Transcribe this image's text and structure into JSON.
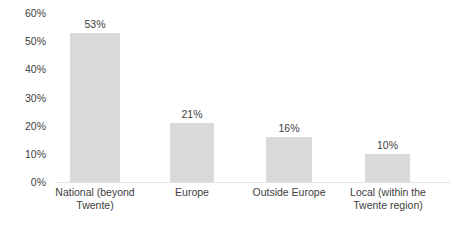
{
  "chart_data": {
    "type": "bar",
    "title": "",
    "subtitle": "",
    "xlabel": "",
    "ylabel": "",
    "categories": [
      "National (beyond Twente)",
      "Europe",
      "Outside Europe",
      "Local (within the Twente region)"
    ],
    "category_lines": [
      [
        "National (beyond",
        "Twente)"
      ],
      [
        "Europe"
      ],
      [
        "Outside Europe"
      ],
      [
        "Local (within the",
        "Twente region)"
      ]
    ],
    "values": [
      53,
      21,
      16,
      10
    ],
    "value_labels": [
      "53%",
      "21%",
      "16%",
      "10%"
    ],
    "ylim": [
      0,
      60
    ],
    "ytick_values": [
      0,
      10,
      20,
      30,
      40,
      50,
      60
    ],
    "ytick_labels": [
      "0%",
      "10%",
      "20%",
      "30%",
      "40%",
      "50%",
      "60%"
    ],
    "grid": false,
    "legend": false,
    "legend_position": "none",
    "bar_color": "#d9d9d9",
    "text_color": "#404040",
    "axis_color": "#e3e3e3",
    "background_color": "#ffffff"
  }
}
